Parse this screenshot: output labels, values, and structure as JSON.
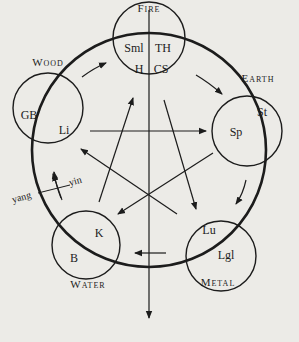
{
  "diagram": {
    "elements": [
      {
        "id": "fire",
        "name": "Fire",
        "organs": [
          "Sml",
          "TH",
          "H",
          "CS"
        ]
      },
      {
        "id": "earth",
        "name": "Earth",
        "organs": [
          "Sp",
          "St"
        ]
      },
      {
        "id": "metal",
        "name": "Metal",
        "organs": [
          "Lu",
          "Lgl"
        ]
      },
      {
        "id": "water",
        "name": "Water",
        "organs": [
          "K",
          "B"
        ]
      },
      {
        "id": "wood",
        "name": "Wood",
        "organs": [
          "GB",
          "Li"
        ]
      }
    ],
    "polarity": {
      "left": "yang",
      "right": "yin"
    },
    "cycles": {
      "generating": [
        "Wood",
        "Fire",
        "Earth",
        "Metal",
        "Water",
        "Wood"
      ],
      "controlling": [
        [
          "Wood",
          "Earth"
        ],
        [
          "Earth",
          "Water"
        ],
        [
          "Water",
          "Fire"
        ],
        [
          "Fire",
          "Metal"
        ],
        [
          "Metal",
          "Wood"
        ]
      ]
    },
    "colors": {
      "ink": "#1c1c1c",
      "paper": "#ecebe7"
    }
  }
}
